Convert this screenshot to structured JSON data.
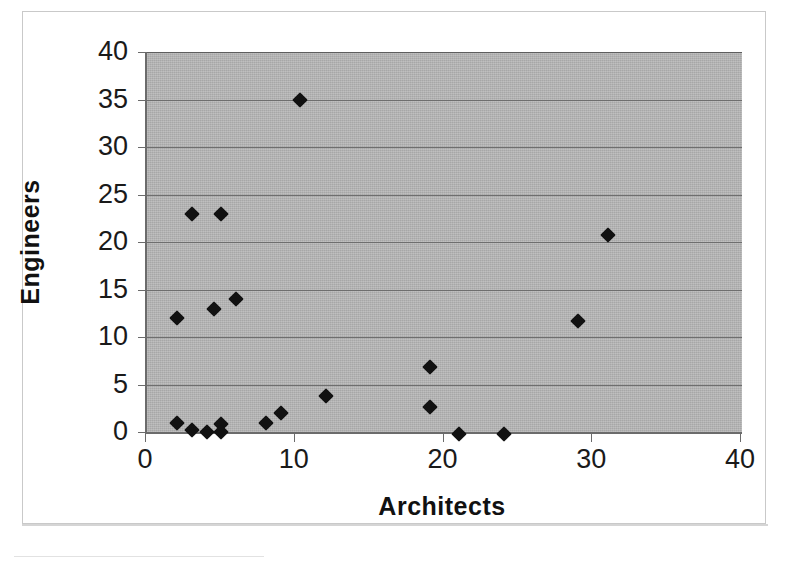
{
  "chart_data": {
    "type": "scatter",
    "title": "",
    "xlabel": "Architects",
    "ylabel": "Engineers",
    "xlim": [
      0,
      40
    ],
    "ylim": [
      0,
      40
    ],
    "xticks": [
      0,
      10,
      20,
      30,
      40
    ],
    "yticks": [
      0,
      5,
      10,
      15,
      20,
      25,
      30,
      35,
      40
    ],
    "grid": "horizontal",
    "legend": "none",
    "marker": "diamond",
    "marker_color": "#111111",
    "plot_background": "#b3b3b3",
    "series": [
      {
        "name": "Firms",
        "points": [
          {
            "x": 2,
            "y": 12
          },
          {
            "x": 2,
            "y": 1
          },
          {
            "x": 3,
            "y": 23
          },
          {
            "x": 3,
            "y": 0.2
          },
          {
            "x": 4,
            "y": 0
          },
          {
            "x": 4.5,
            "y": 13
          },
          {
            "x": 5,
            "y": 23
          },
          {
            "x": 5,
            "y": 0.8
          },
          {
            "x": 5,
            "y": 0
          },
          {
            "x": 6,
            "y": 14
          },
          {
            "x": 8,
            "y": 0.9
          },
          {
            "x": 9,
            "y": 2
          },
          {
            "x": 10.3,
            "y": 35
          },
          {
            "x": 12,
            "y": 3.8
          },
          {
            "x": 19,
            "y": 6.8
          },
          {
            "x": 19,
            "y": 2.6
          },
          {
            "x": 21,
            "y": -0.2
          },
          {
            "x": 24,
            "y": -0.2
          },
          {
            "x": 29,
            "y": 11.7
          },
          {
            "x": 31,
            "y": 20.7
          }
        ]
      }
    ]
  },
  "axes": {
    "y_tick_labels": [
      "40",
      "35",
      "30",
      "25",
      "20",
      "15",
      "10",
      "5",
      "0"
    ],
    "x_tick_labels": [
      "0",
      "10",
      "20",
      "30",
      "40"
    ],
    "y_title": "Engineers",
    "x_title": "Architects"
  }
}
